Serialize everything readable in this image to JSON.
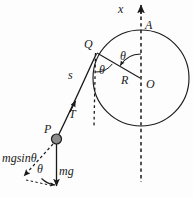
{
  "figure": {
    "type": "physics-force-diagram",
    "background_color": "#fdfdfd",
    "stroke_color": "#1a1a1a",
    "point_fill_color": "#8c8c8c",
    "labels": {
      "axis_x": "x",
      "point_a": "A",
      "point_q": "Q",
      "point_o": "O",
      "point_p": "P",
      "radius": "R",
      "arc_length": "s",
      "tension": "T",
      "weight": "mg",
      "tangential_weight": "mgsinθ",
      "angle_at_center": "θ",
      "angle_at_q": "θ",
      "angle_at_p": "θ"
    },
    "geometry": {
      "circle_center": [
        141,
        78
      ],
      "circle_radius": 48,
      "point_a": [
        141,
        30
      ],
      "point_q": [
        96,
        52
      ],
      "point_p": [
        56,
        139
      ],
      "axis_top": [
        141,
        5
      ],
      "axis_bottom": [
        141,
        182
      ],
      "dashed_vertical_from_q_bottom": [
        94,
        126
      ],
      "mg_arrow_tip": [
        56,
        187
      ],
      "mgsin_arrow_tip": [
        22,
        177
      ]
    },
    "elements": {
      "circle": "hoop",
      "vertical_axis": "dashed-vertical-axis-through-A-and-O",
      "radius_line": "OQ",
      "string": "curved-string-from-P-tangent-at-Q",
      "weight_vector": "mg-downward-solid-arrow",
      "tangential_component": "mgsin-theta-dashed-arrow-along-string-direction"
    }
  }
}
